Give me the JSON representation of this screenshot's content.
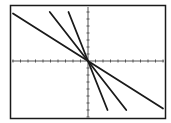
{
  "chart_data": {
    "type": "line",
    "title": "",
    "xlabel": "",
    "ylabel": "",
    "grid": false,
    "legend": "none",
    "xlim": [
      -10,
      10
    ],
    "ylim": [
      -10,
      10
    ],
    "x_tick_step": 1,
    "y_tick_step": 1,
    "series": [
      {
        "name": "line-1",
        "slope": -0.68,
        "intercept": 0,
        "x": [
          -10,
          10
        ],
        "y": [
          6.8,
          -6.8
        ]
      },
      {
        "name": "line-2",
        "slope": -1.37,
        "intercept": 0,
        "x": [
          -5.1,
          5.1
        ],
        "y": [
          7,
          -7
        ]
      },
      {
        "name": "line-3",
        "slope": -2.73,
        "intercept": 0,
        "x": [
          -2.6,
          2.6
        ],
        "y": [
          7,
          -7
        ]
      }
    ]
  },
  "colors": {
    "background": "#ffffff",
    "frame": "#1a1a1a",
    "axis": "#555555",
    "line": "#1a1a1a"
  }
}
